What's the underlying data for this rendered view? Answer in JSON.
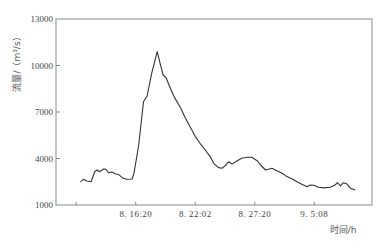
{
  "chart_data": {
    "type": "line",
    "title": "",
    "xlabel": "时间/h",
    "ylabel": "流量/（m³/s）",
    "ylim": [
      1000,
      13000
    ],
    "xlim": [
      -0.34,
      4.97
    ],
    "y_ticks": [
      1000,
      4000,
      7000,
      10000,
      13000
    ],
    "y_tick_labels": [
      "1000",
      "4000",
      "7000",
      "10000",
      "13000"
    ],
    "x_ticks": [
      0,
      1,
      2,
      3,
      4
    ],
    "x_tick_labels": [
      "",
      "8. 16:20",
      "8. 22:02",
      "8. 27:20",
      "9. 5:08"
    ],
    "grid": false,
    "legend": null,
    "series": [
      {
        "name": "流量",
        "x": [
          0.07,
          0.12,
          0.18,
          0.25,
          0.31,
          0.35,
          0.39,
          0.46,
          0.5,
          0.54,
          0.6,
          0.66,
          0.71,
          0.79,
          0.85,
          0.94,
          0.97,
          1.05,
          1.13,
          1.19,
          1.27,
          1.36,
          1.41,
          1.46,
          1.51,
          1.58,
          1.66,
          1.75,
          1.83,
          1.92,
          2.0,
          2.08,
          2.17,
          2.25,
          2.31,
          2.39,
          2.45,
          2.5,
          2.56,
          2.62,
          2.7,
          2.78,
          2.87,
          2.95,
          3.04,
          3.09,
          3.18,
          3.23,
          3.29,
          3.37,
          3.46,
          3.54,
          3.63,
          3.71,
          3.79,
          3.88,
          3.93,
          3.99,
          4.07,
          4.16,
          4.27,
          4.35,
          4.39,
          4.44,
          4.49,
          4.55,
          4.61,
          4.69
        ],
        "values": [
          2500,
          2660,
          2550,
          2500,
          3150,
          3260,
          3150,
          3320,
          3300,
          3080,
          3130,
          3000,
          2980,
          2720,
          2660,
          2680,
          3060,
          4870,
          7660,
          8030,
          9520,
          10900,
          10140,
          9390,
          9210,
          8530,
          7880,
          7290,
          6650,
          6000,
          5410,
          4980,
          4550,
          4120,
          3690,
          3410,
          3370,
          3520,
          3790,
          3650,
          3840,
          4010,
          4080,
          4080,
          3860,
          3610,
          3260,
          3300,
          3370,
          3210,
          3050,
          2830,
          2680,
          2500,
          2340,
          2180,
          2290,
          2270,
          2140,
          2100,
          2140,
          2290,
          2440,
          2230,
          2440,
          2350,
          2080,
          1970
        ]
      }
    ]
  },
  "colors": {
    "line": "#333333",
    "frame": "#8a8a8a",
    "tick": "#8a8a8a",
    "text": "#444444",
    "background": "#ffffff"
  }
}
